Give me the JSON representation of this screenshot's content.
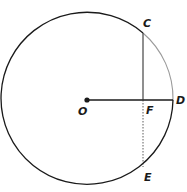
{
  "diagram": {
    "center": {
      "label": "O",
      "x": 87,
      "y": 100
    },
    "radius": 86,
    "points": [
      {
        "label": "C",
        "x": 143,
        "y": 33
      },
      {
        "label": "D",
        "x": 173,
        "y": 100
      },
      {
        "label": "E",
        "x": 143,
        "y": 167
      },
      {
        "label": "F",
        "x": 143,
        "y": 100
      }
    ],
    "segments": [
      {
        "from": "O",
        "to": "D",
        "style": "solid"
      },
      {
        "from": "C",
        "to": "F",
        "style": "solid"
      },
      {
        "from": "F",
        "to": "E",
        "style": "dashed"
      }
    ],
    "highlighted_arc": {
      "from": "C",
      "to": "D",
      "color": "#9a9a9a"
    },
    "colors": {
      "stroke": "#1a1a1a",
      "arc": "#9a9a9a"
    }
  }
}
